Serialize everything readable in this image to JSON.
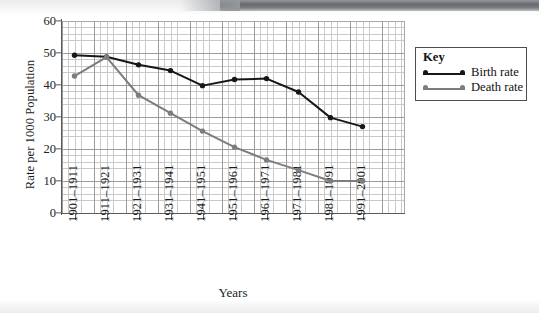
{
  "chart_data": {
    "type": "line",
    "title": "",
    "xlabel": "Years",
    "ylabel": "Rate per 1000 Population",
    "ylim": [
      0,
      60
    ],
    "yticks": [
      0,
      10,
      20,
      30,
      40,
      50,
      60
    ],
    "ytick_labels": [
      "0",
      "10",
      "20",
      "30",
      "40",
      "50",
      "60"
    ],
    "grid": true,
    "grid_style": "graph-paper, minor 1-unit cells with major 5-unit lines",
    "legend_position": "right, outside plot area",
    "legend_title": "Key",
    "categories": [
      "1901–1911",
      "1911–1921",
      "1921–1931",
      "1931–1941",
      "1941–1951",
      "1951–1961",
      "1961–1971",
      "1971–1981",
      "1981–1991",
      "1991–2001"
    ],
    "series": [
      {
        "name": "Birth rate",
        "color": "#171717",
        "marker": "circle",
        "values": [
          49.3,
          48.8,
          46.3,
          44.5,
          39.8,
          41.7,
          42.0,
          37.8,
          29.8,
          27.0
        ]
      },
      {
        "name": "Death rate",
        "color": "#7d7d7d",
        "marker": "circle",
        "values": [
          42.8,
          48.7,
          36.8,
          31.2,
          25.6,
          20.6,
          16.6,
          13.4,
          10.0,
          10.0
        ]
      }
    ]
  },
  "axes": {
    "y_title": "Rate per 1000 Population",
    "x_title": "Years"
  },
  "legend": {
    "title": "Key",
    "entries": [
      {
        "label": "Birth rate",
        "color": "#171717"
      },
      {
        "label": "Death rate",
        "color": "#7d7d7d"
      }
    ]
  },
  "colors": {
    "birth_rate": "#171717",
    "death_rate": "#7d7d7d",
    "grid_minor": "#c9c9c9",
    "grid_major": "#9b9b9b",
    "axis": "#5a5a5a",
    "text": "#1c1c1c",
    "page_background": "#ffffff"
  }
}
